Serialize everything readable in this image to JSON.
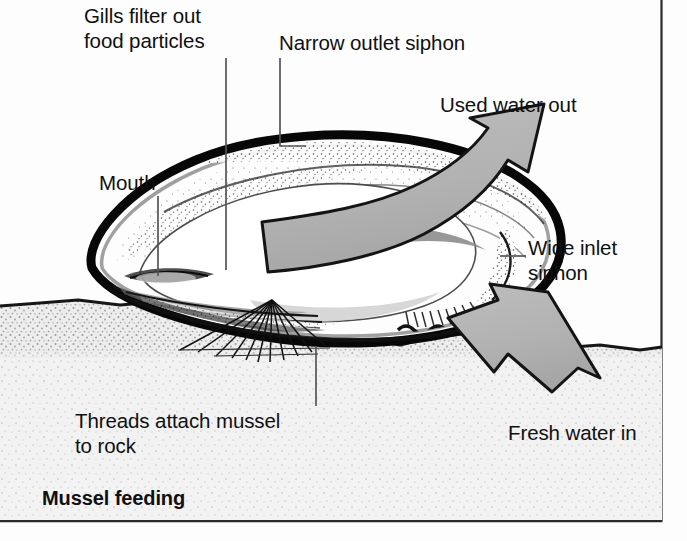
{
  "figure": {
    "caption": "Mussel feeding",
    "subject": "mussel",
    "background_color": "#fdfdfd",
    "frame_color": "#1a1a1a"
  },
  "labels": {
    "gills": "Gills filter out\nfood particles",
    "narrow_outlet_siphon": "Narrow outlet siphon",
    "used_water_out": "Used water out",
    "mouth": "Mouth",
    "wide_inlet_siphon": "Wide inlet\nsiphon",
    "threads": "Threads attach mussel\nto rock",
    "fresh_water_in": "Fresh water in"
  },
  "colors": {
    "ink": "#101010",
    "arrow_fill": "#b4b4b4",
    "arrow_outline": "#141414",
    "shell_outline": "#080808",
    "shell_interior": "#fdfdfd",
    "mantle_shadow": "#8e8e8e",
    "rock_fill": "#e9e9e9",
    "rock_edge": "#141414",
    "leader_line": "#4a4a4a"
  },
  "arrows": [
    {
      "name": "used-water-out-arrow",
      "label": "Used water out",
      "direction": "up-right",
      "style": "curved",
      "fill": "#b4b4b4"
    },
    {
      "name": "fresh-water-in-arrow",
      "label": "Fresh water in",
      "direction": "up-left",
      "style": "straight",
      "fill": "#b4b4b4"
    }
  ],
  "parts": [
    {
      "name": "shell",
      "label": "shell"
    },
    {
      "name": "gills",
      "label": "Gills filter out food particles"
    },
    {
      "name": "mouth",
      "label": "Mouth"
    },
    {
      "name": "outlet-siphon",
      "label": "Narrow outlet siphon"
    },
    {
      "name": "inlet-siphon",
      "label": "Wide inlet siphon"
    },
    {
      "name": "byssal-threads",
      "label": "Threads attach mussel to rock"
    },
    {
      "name": "rock",
      "label": "rock"
    }
  ]
}
